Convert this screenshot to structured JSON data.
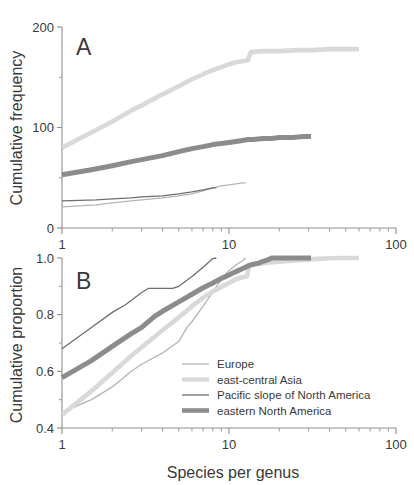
{
  "figure": {
    "background_color": "#ffffff",
    "axis_color": "#8d8d8d",
    "text_color": "#3a3a3a"
  },
  "panel_a_letter": "A",
  "panel_b_letter": "B",
  "xlabel": "Species per genus",
  "legend": {
    "items": [
      {
        "label": "Europe",
        "color": "#b4b4b4",
        "width": 1.3
      },
      {
        "label": "east-central Asia",
        "color": "#d9d9d9",
        "width": 4.2
      },
      {
        "label": "Pacific slope of North America",
        "color": "#6e6e6e",
        "width": 1.3
      },
      {
        "label": "eastern North America",
        "color": "#8c8c8c",
        "width": 4.6
      }
    ]
  },
  "chart_data": [
    {
      "type": "line",
      "panel": "A",
      "title": "A",
      "xlabel": "Species per genus",
      "ylabel": "Cumulative frequency",
      "xscale": "log",
      "xlim": [
        1,
        100
      ],
      "ylim": [
        0,
        200
      ],
      "yticks": [
        0,
        100,
        200
      ],
      "ytick_labels": [
        "0",
        "100",
        "200"
      ],
      "xticks": [
        1,
        10,
        100
      ],
      "xtick_labels": [
        "1",
        "10",
        "100"
      ],
      "grid": false,
      "legend_position": "none",
      "series": [
        {
          "name": "Europe",
          "color": "#b4b4b4",
          "width": 1.3,
          "points": [
            [
              1,
              21
            ],
            [
              1.6,
              23
            ],
            [
              2,
              25
            ],
            [
              2.6,
              27
            ],
            [
              3,
              28
            ],
            [
              4,
              30
            ],
            [
              5,
              32
            ],
            [
              6,
              34
            ],
            [
              7,
              37
            ],
            [
              8,
              40
            ],
            [
              9,
              42
            ],
            [
              10,
              43
            ],
            [
              11,
              44
            ],
            [
              12,
              45
            ],
            [
              12.6,
              45
            ]
          ]
        },
        {
          "name": "east-central Asia",
          "color": "#d9d9d9",
          "width": 4.6,
          "points": [
            [
              1,
              80
            ],
            [
              1.5,
              95
            ],
            [
              2,
              106
            ],
            [
              2.6,
              117
            ],
            [
              3,
              122
            ],
            [
              4,
              133
            ],
            [
              5,
              141
            ],
            [
              6,
              148
            ],
            [
              7,
              153
            ],
            [
              8,
              157
            ],
            [
              9,
              160
            ],
            [
              10,
              163
            ],
            [
              11,
              165
            ],
            [
              12,
              166
            ],
            [
              13,
              167
            ],
            [
              13.5,
              175
            ],
            [
              16,
              176
            ],
            [
              20,
              176
            ],
            [
              26,
              177
            ],
            [
              32,
              177
            ],
            [
              40,
              178
            ],
            [
              50,
              178
            ],
            [
              60,
              178
            ]
          ]
        },
        {
          "name": "Pacific slope of North America",
          "color": "#6e6e6e",
          "width": 1.3,
          "points": [
            [
              1,
              27
            ],
            [
              1.6,
              28
            ],
            [
              2,
              29
            ],
            [
              2.6,
              30
            ],
            [
              3,
              31
            ],
            [
              4,
              32
            ],
            [
              5,
              34
            ],
            [
              6,
              36
            ],
            [
              7,
              38
            ],
            [
              8,
              40
            ],
            [
              8.4,
              40
            ]
          ]
        },
        {
          "name": "eastern North America",
          "color": "#8c8c8c",
          "width": 5.0,
          "points": [
            [
              1,
              53
            ],
            [
              1.5,
              58
            ],
            [
              2,
              62
            ],
            [
              2.6,
              66
            ],
            [
              3,
              68
            ],
            [
              4,
              72
            ],
            [
              5,
              76
            ],
            [
              6,
              79
            ],
            [
              7,
              81
            ],
            [
              8,
              83
            ],
            [
              9,
              84
            ],
            [
              10,
              85
            ],
            [
              11,
              86
            ],
            [
              12,
              87
            ],
            [
              13,
              88
            ],
            [
              14,
              88
            ],
            [
              16,
              89
            ],
            [
              18,
              89
            ],
            [
              20,
              90
            ],
            [
              24,
              90
            ],
            [
              28,
              91
            ],
            [
              31,
              91
            ]
          ]
        }
      ]
    },
    {
      "type": "line",
      "panel": "B",
      "title": "B",
      "xlabel": "Species per genus",
      "ylabel": "Cumulative proportion",
      "xscale": "log",
      "xlim": [
        1,
        100
      ],
      "ylim": [
        0.4,
        1.0
      ],
      "yticks": [
        0.4,
        0.6,
        0.8,
        1.0
      ],
      "ytick_labels": [
        "0.4",
        "0.6",
        "0.8",
        "1.0"
      ],
      "xticks": [
        1,
        10,
        100
      ],
      "xtick_labels": [
        "1",
        "10",
        "100"
      ],
      "grid": false,
      "legend_position": "inside-lower-right",
      "series": [
        {
          "name": "Europe",
          "color": "#b4b4b4",
          "width": 1.3,
          "points": [
            [
              1,
              0.455
            ],
            [
              1.5,
              0.5
            ],
            [
              2,
              0.545
            ],
            [
              2.6,
              0.6
            ],
            [
              3,
              0.625
            ],
            [
              4,
              0.665
            ],
            [
              5,
              0.705
            ],
            [
              5.6,
              0.755
            ],
            [
              6,
              0.775
            ],
            [
              7,
              0.83
            ],
            [
              8,
              0.88
            ],
            [
              9,
              0.925
            ],
            [
              9.6,
              0.945
            ],
            [
              10,
              0.955
            ],
            [
              11,
              0.975
            ],
            [
              12,
              0.99
            ],
            [
              12.6,
              1.0
            ]
          ]
        },
        {
          "name": "east-central Asia",
          "color": "#d9d9d9",
          "width": 4.6,
          "points": [
            [
              1,
              0.447
            ],
            [
              1.5,
              0.53
            ],
            [
              2,
              0.595
            ],
            [
              2.6,
              0.655
            ],
            [
              3,
              0.685
            ],
            [
              4,
              0.745
            ],
            [
              5,
              0.79
            ],
            [
              6,
              0.83
            ],
            [
              7,
              0.86
            ],
            [
              8,
              0.882
            ],
            [
              9,
              0.898
            ],
            [
              10,
              0.912
            ],
            [
              11,
              0.925
            ],
            [
              12,
              0.932
            ],
            [
              12.8,
              0.935
            ],
            [
              13.2,
              0.975
            ],
            [
              16,
              0.982
            ],
            [
              20,
              0.987
            ],
            [
              26,
              0.992
            ],
            [
              32,
              0.996
            ],
            [
              40,
              0.999
            ],
            [
              50,
              1.0
            ],
            [
              60,
              1.0
            ]
          ]
        },
        {
          "name": "Pacific slope of North America",
          "color": "#6e6e6e",
          "width": 1.3,
          "points": [
            [
              1,
              0.68
            ],
            [
              1.5,
              0.755
            ],
            [
              2,
              0.808
            ],
            [
              2.4,
              0.835
            ],
            [
              3,
              0.878
            ],
            [
              3.3,
              0.893
            ],
            [
              4,
              0.893
            ],
            [
              4.6,
              0.893
            ],
            [
              5,
              0.9
            ],
            [
              6,
              0.935
            ],
            [
              7,
              0.967
            ],
            [
              8,
              0.998
            ],
            [
              8.4,
              1.0
            ]
          ]
        },
        {
          "name": "eastern North America",
          "color": "#8c8c8c",
          "width": 5.0,
          "points": [
            [
              1,
              0.578
            ],
            [
              1.5,
              0.638
            ],
            [
              2,
              0.688
            ],
            [
              2.6,
              0.733
            ],
            [
              3,
              0.755
            ],
            [
              3.6,
              0.795
            ],
            [
              4,
              0.812
            ],
            [
              5,
              0.845
            ],
            [
              6,
              0.872
            ],
            [
              7,
              0.895
            ],
            [
              8,
              0.912
            ],
            [
              9,
              0.928
            ],
            [
              10,
              0.94
            ],
            [
              11,
              0.952
            ],
            [
              12,
              0.962
            ],
            [
              13,
              0.972
            ],
            [
              14,
              0.978
            ],
            [
              15,
              0.982
            ],
            [
              16,
              0.988
            ],
            [
              17,
              0.993
            ],
            [
              18,
              1.0
            ],
            [
              22,
              1.0
            ],
            [
              26,
              1.0
            ],
            [
              31,
              1.0
            ]
          ]
        }
      ]
    }
  ]
}
